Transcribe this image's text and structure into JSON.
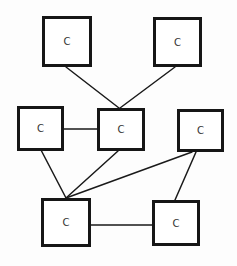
{
  "diagram": {
    "type": "graph",
    "nodes": [
      {
        "id": "n1",
        "label": "C",
        "x": 42,
        "y": 16,
        "w": 50,
        "h": 51
      },
      {
        "id": "n2",
        "label": "C",
        "x": 153,
        "y": 17,
        "w": 49,
        "h": 50
      },
      {
        "id": "n3",
        "label": "C",
        "x": 17,
        "y": 106,
        "w": 47,
        "h": 45
      },
      {
        "id": "n4",
        "label": "C",
        "x": 97,
        "y": 108,
        "w": 48,
        "h": 43
      },
      {
        "id": "n5",
        "label": "C",
        "x": 177,
        "y": 109,
        "w": 47,
        "h": 43
      },
      {
        "id": "n6",
        "label": "C",
        "x": 41,
        "y": 198,
        "w": 50,
        "h": 49
      },
      {
        "id": "n7",
        "label": "C",
        "x": 152,
        "y": 200,
        "w": 48,
        "h": 46
      }
    ],
    "edges": [
      {
        "from": "n1",
        "to": "n4",
        "x1": 66,
        "y1": 67,
        "x2": 119,
        "y2": 108
      },
      {
        "from": "n2",
        "to": "n4",
        "x1": 175,
        "y1": 67,
        "x2": 120,
        "y2": 108
      },
      {
        "from": "n3",
        "to": "n4",
        "x1": 64,
        "y1": 129,
        "x2": 97,
        "y2": 129
      },
      {
        "from": "n3",
        "to": "n6",
        "x1": 41,
        "y1": 150,
        "x2": 66,
        "y2": 198
      },
      {
        "from": "n4",
        "to": "n6",
        "x1": 118,
        "y1": 151,
        "x2": 66,
        "y2": 198
      },
      {
        "from": "n5",
        "to": "n6",
        "x1": 192,
        "y1": 152,
        "x2": 66,
        "y2": 198
      },
      {
        "from": "n5",
        "to": "n7",
        "x1": 196,
        "y1": 152,
        "x2": 175,
        "y2": 200
      },
      {
        "from": "n6",
        "to": "n7",
        "x1": 91,
        "y1": 225,
        "x2": 152,
        "y2": 225
      }
    ],
    "colors": {
      "stroke": "#161616",
      "fill": "#ffffff",
      "label": "#333333"
    }
  }
}
